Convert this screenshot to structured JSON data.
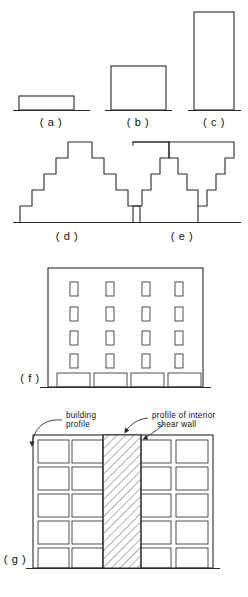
{
  "figure": {
    "background_color": "#ffffff",
    "line_color": "#2b2b2b",
    "hatch_color": "#2b2b2b"
  },
  "captions": {
    "a": "( a )",
    "b": "( b )",
    "c": "( c )",
    "d": "( d )",
    "e": "( e )",
    "f": "( f )",
    "g": "( g )"
  },
  "annotations": {
    "building_profile_line1": "building",
    "building_profile_line2": "profile",
    "shear_wall_line1": "profile of interior",
    "shear_wall_line2": "shear  wall"
  },
  "panels": [
    {
      "id": "a",
      "label": "( a )",
      "type": "rectangle-profile",
      "description": "low wide rectangular building profile on ground line",
      "relative_width": "wide",
      "relative_height": "low"
    },
    {
      "id": "b",
      "label": "( b )",
      "type": "rectangle-profile",
      "description": "medium square building profile on ground line",
      "relative_width": "medium",
      "relative_height": "medium"
    },
    {
      "id": "c",
      "label": "( c )",
      "type": "rectangle-profile",
      "description": "tall narrow building profile on ground line",
      "relative_width": "narrow",
      "relative_height": "tall"
    },
    {
      "id": "d",
      "label": "( d )",
      "type": "stepped-pyramid",
      "description": "symmetric stepped pyramid profile, 5 setback levels, widest at base",
      "levels": 5
    },
    {
      "id": "e",
      "label": "( e )",
      "type": "inverted-stepped-pyramid",
      "description": "inverted stepped profile, widest at top, narrowing to two legs at base",
      "levels": 5,
      "legs": 2
    },
    {
      "id": "f",
      "label": "( f )",
      "type": "elevation-with-openings",
      "description": "building elevation with 4 rows by 4 columns of small windows above 4 wide ground floor bays",
      "window_rows": 4,
      "window_columns": 4,
      "ground_bays": 4
    },
    {
      "id": "g",
      "label": "( g )",
      "type": "frame-with-shear-wall",
      "description": "five story frame elevation, 5 bays wide, with hatched interior shear wall occupying the center bay full height",
      "stories": 5,
      "bays": 5,
      "shear_wall_bay_index": 3
    }
  ]
}
